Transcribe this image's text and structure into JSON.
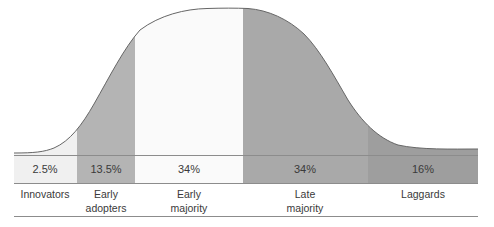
{
  "chart_data": {
    "type": "area",
    "title": "",
    "subtitle": "",
    "xlabel": "",
    "ylabel": "",
    "grid": false,
    "legend_position": "none",
    "categories": [
      "Innovators",
      "Early adopters",
      "Early majority",
      "Late majority",
      "Laggards"
    ],
    "values": [
      2.5,
      13.5,
      34,
      34,
      16
    ],
    "value_labels": [
      "2.5%",
      "13.5%",
      "34%",
      "34%",
      "16%"
    ],
    "ylim": [
      0,
      100
    ],
    "segments": [
      {
        "key": "innovators",
        "label_line1": "Innovators",
        "label_line2": "",
        "percent_label": "2.5%",
        "percent_value": 2.5,
        "fill": "#f0f0f0",
        "x_start": 14,
        "x_end": 77,
        "pct_center_x": 45,
        "cat_center_x": 45
      },
      {
        "key": "early-adopters",
        "label_line1": "Early",
        "label_line2": "adopters",
        "percent_label": "13.5%",
        "percent_value": 13.5,
        "fill": "#b4b4b4",
        "x_start": 77,
        "x_end": 135,
        "pct_center_x": 106,
        "cat_center_x": 106
      },
      {
        "key": "early-majority",
        "label_line1": "Early",
        "label_line2": "majority",
        "percent_label": "34%",
        "percent_value": 34,
        "fill": "#fafafa",
        "x_start": 135,
        "x_end": 243,
        "pct_center_x": 189,
        "cat_center_x": 189
      },
      {
        "key": "late-majority",
        "label_line1": "Late",
        "label_line2": "majority",
        "percent_label": "34%",
        "percent_value": 34,
        "fill": "#a9a9a9",
        "x_start": 243,
        "x_end": 368,
        "pct_center_x": 305,
        "cat_center_x": 305
      },
      {
        "key": "laggards",
        "label_line1": "Laggards",
        "label_line2": "",
        "percent_label": "16%",
        "percent_value": 16,
        "fill": "#9e9e9e",
        "x_start": 368,
        "x_end": 478,
        "pct_center_x": 423,
        "cat_center_x": 423
      }
    ],
    "curve": {
      "stroke_color": "#666666",
      "stroke_width": 1,
      "baseline_y": 155,
      "peak_x": 245,
      "peak_y": 8,
      "left_x": 14,
      "right_x": 478,
      "left_tail_y": 153,
      "right_tail_y": 149
    },
    "axis_lines": {
      "color": "#8c8c8c",
      "baseline_y": 155,
      "label_divider_y": 183,
      "bottom_rule_y": 216,
      "x_start": 14,
      "x_end": 478
    },
    "colors": {
      "background": "#ffffff",
      "text": "#3a3a3a",
      "rule": "#8c8c8c",
      "curve_stroke": "#666666"
    }
  }
}
